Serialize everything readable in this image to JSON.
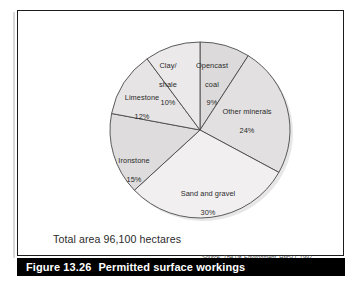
{
  "figure": {
    "number": "Figure 13.26",
    "title": "Permitted surface workings",
    "total_area": "Total area 96,100 hectares",
    "source_prefix": "Source:",
    "source_title": "The UK Environment",
    "source_rest": ", HMSO, 1992"
  },
  "colors": {
    "bar_background": "#000000",
    "bar_text": "#ffffff",
    "panel_border": "#1b1b1b",
    "slice_light": "#eceaea",
    "slice_mid": "#dcdada",
    "slice_dark": "#cfcdcd",
    "slice_outline": "#4a4a4a"
  },
  "chart_data": {
    "type": "pie",
    "title": "Permitted surface workings",
    "subtitle": "Total area 96,100 hectares",
    "unit": "percent",
    "total_label": "96,100 hectares",
    "start_angle_deg": 0,
    "direction": "clockwise",
    "legend": "none (labels inside slices)",
    "categories": [
      "Opencast coal",
      "Other minerals",
      "Sand and gravel",
      "Ironstone",
      "Limestone",
      "Clay/shale"
    ],
    "values": [
      9,
      24,
      30,
      15,
      12,
      10
    ],
    "slices": [
      {
        "name": "Opencast coal",
        "label_line1": "Opencast",
        "label_line2": "coal",
        "value": 9,
        "value_label": "9%",
        "fill": "#dcdada",
        "label_left": 95,
        "label_top": 27,
        "label_width": 48
      },
      {
        "name": "Other minerals",
        "label_line1": "Other minerals",
        "label_line2": "",
        "value": 24,
        "value_label": "24%",
        "fill": "#e2e0e0",
        "label_left": 118,
        "label_top": 73,
        "label_width": 72
      },
      {
        "name": "Sand and gravel",
        "label_line1": "Sand and gravel",
        "label_line2": "",
        "value": 30,
        "value_label": "30%",
        "fill": "#f1efef",
        "label_left": 76,
        "label_top": 155,
        "label_width": 78
      },
      {
        "name": "Ironstone",
        "label_line1": "Ironstone",
        "label_line2": "",
        "value": 15,
        "value_label": "15%",
        "fill": "#dedcdc",
        "label_left": 13,
        "label_top": 122,
        "label_width": 56
      },
      {
        "name": "Limestone",
        "label_line1": "Limestone",
        "label_line2": "",
        "value": 12,
        "value_label": "12%",
        "fill": "#e6e4e4",
        "label_left": 20,
        "label_top": 59,
        "label_width": 58
      },
      {
        "name": "Clay/shale",
        "label_line1": "Clay/",
        "label_line2": "shale",
        "value": 10,
        "value_label": "10%",
        "fill": "#ebe9e9",
        "label_left": 55,
        "label_top": 27,
        "label_width": 40
      }
    ]
  }
}
